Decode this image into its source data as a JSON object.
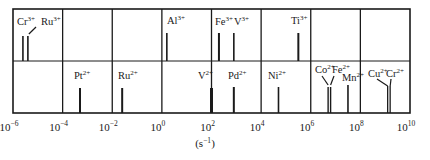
{
  "chart_data": {
    "type": "scatter",
    "title": "",
    "xlabel": "(s⁻¹)",
    "ylabel": "",
    "xscale": "log",
    "xlim_log10": [
      -6,
      10
    ],
    "x_ticks": [
      {
        "exp": -6,
        "label": "10",
        "sup": "−6"
      },
      {
        "exp": -4,
        "label": "10",
        "sup": "−4"
      },
      {
        "exp": -2,
        "label": "10",
        "sup": "−2"
      },
      {
        "exp": 0,
        "label": "10",
        "sup": "0"
      },
      {
        "exp": 2,
        "label": "10",
        "sup": "2"
      },
      {
        "exp": 4,
        "label": "10",
        "sup": "4"
      },
      {
        "exp": 6,
        "label": "10",
        "sup": "6"
      },
      {
        "exp": 8,
        "label": "10",
        "sup": "8"
      },
      {
        "exp": 10,
        "label": "10",
        "sup": "10"
      }
    ],
    "grid": true,
    "rows": [
      {
        "name": "M3+",
        "points": [
          {
            "ion": "Cr",
            "charge": "3+",
            "log10_rate": -5.6
          },
          {
            "ion": "Ru",
            "charge": "3+",
            "log10_rate": -5.4
          },
          {
            "ion": "Al",
            "charge": "3+",
            "log10_rate": 0.2
          },
          {
            "ion": "Fe",
            "charge": "3+",
            "log10_rate": 2.3
          },
          {
            "ion": "V",
            "charge": "3+",
            "log10_rate": 2.9
          },
          {
            "ion": "Ti",
            "charge": "3+",
            "log10_rate": 5.5
          }
        ]
      },
      {
        "name": "M2+",
        "points": [
          {
            "ion": "Pt",
            "charge": "2+",
            "log10_rate": -3.3
          },
          {
            "ion": "Ru",
            "charge": "2+",
            "log10_rate": -1.6
          },
          {
            "ion": "V",
            "charge": "2+",
            "log10_rate": 2.0
          },
          {
            "ion": "Pd",
            "charge": "2+",
            "log10_rate": 2.9
          },
          {
            "ion": "Ni",
            "charge": "2+",
            "log10_rate": 4.7
          },
          {
            "ion": "Co",
            "charge": "2+",
            "log10_rate": 6.7
          },
          {
            "ion": "Fe",
            "charge": "2+",
            "log10_rate": 6.8
          },
          {
            "ion": "Mn",
            "charge": "2+",
            "log10_rate": 7.5
          },
          {
            "ion": "Cu",
            "charge": "2+",
            "log10_rate": 9.1
          },
          {
            "ion": "Cr",
            "charge": "2+",
            "log10_rate": 9.2
          }
        ]
      }
    ]
  }
}
